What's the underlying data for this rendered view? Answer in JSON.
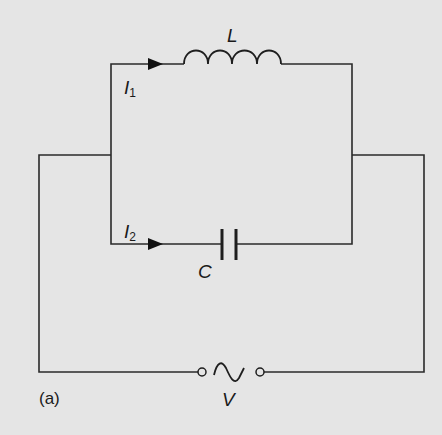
{
  "diagram": {
    "type": "circuit",
    "caption": "(a)",
    "colors": {
      "background": "#e5e5e5",
      "lines": "#2a2a2a"
    },
    "components": {
      "inductor": {
        "label": "L"
      },
      "capacitor": {
        "label": "C"
      },
      "source": {
        "label": "V",
        "symbol": "ac-sine"
      }
    },
    "currents": [
      {
        "symbol": "I",
        "subscript": "1",
        "branch": "inductor"
      },
      {
        "symbol": "I",
        "subscript": "2",
        "branch": "capacitor"
      }
    ]
  }
}
